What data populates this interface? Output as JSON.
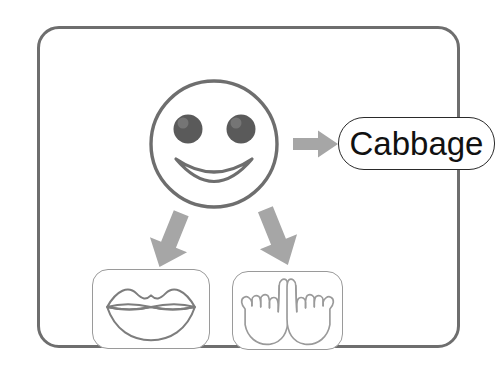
{
  "scene": {
    "title": "Communication support board",
    "background_color": "#ffffff",
    "frame": {
      "name": "outer-frame",
      "border_color": "#6e6e6e",
      "fill_color": "#ffffff",
      "corner_radius": "22px"
    }
  },
  "face": {
    "icon_name": "smiley-face-icon",
    "alt_text": "Smiling face",
    "outline_color": "#6e6e6e",
    "eye_color": "#5a5a5a",
    "mouth_color": "#6e6e6e"
  },
  "label": {
    "name": "cabbage-label",
    "text": "Cabbage",
    "text_color": "#111111",
    "border_color": "#2a2a2a",
    "fill_color": "#ffffff"
  },
  "arrows": [
    {
      "name": "arrow-face-to-label",
      "direction": "right",
      "color": "#a6a6a6",
      "from": "smiley-face-icon",
      "to": "cabbage-label"
    },
    {
      "name": "arrow-face-to-lips",
      "direction": "down-left",
      "color": "#a6a6a6",
      "from": "smiley-face-icon",
      "to": "lips-icon-box"
    },
    {
      "name": "arrow-face-to-hands",
      "direction": "down-right",
      "color": "#a6a6a6",
      "from": "smiley-face-icon",
      "to": "hands-icon-box"
    }
  ],
  "icons": [
    {
      "name": "lips-icon",
      "alt_text": "Lips / speech mouth",
      "box_name": "lips-icon-box",
      "outline_color": "#7d7d7d",
      "border_color": "#9a9a9a",
      "fill_color": "#ffffff"
    },
    {
      "name": "hands-sign-icon",
      "alt_text": "Two hands with index fingers raised (sign language)",
      "box_name": "hands-icon-box",
      "outline_color": "#9a9a9a",
      "border_color": "#9a9a9a",
      "fill_color": "#ffffff"
    }
  ]
}
